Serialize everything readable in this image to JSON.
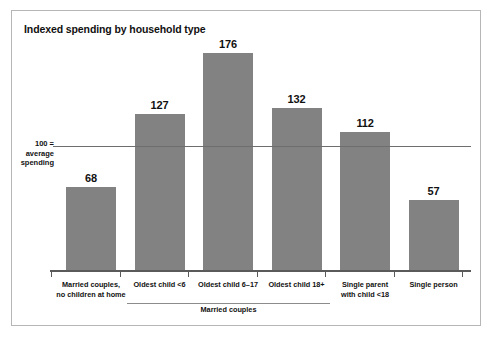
{
  "figure": {
    "title": "Indexed spending by household type",
    "frame_color": "#b6b6b6",
    "bar_color": "#828282",
    "axis_color": "#5a5a5a"
  },
  "reference": {
    "line1": "100 =",
    "line2": "average",
    "line3": "spending",
    "value": 100
  },
  "group": {
    "label": "Married couples"
  },
  "chart_data": {
    "type": "bar",
    "title": "Indexed spending by household type",
    "xlabel": "",
    "ylabel": "",
    "ylim": [
      0,
      185
    ],
    "grid": false,
    "legend": "none",
    "reference_line": {
      "value": 100,
      "label": "100 = average spending"
    },
    "categories": [
      "Married couples, no children at home",
      "Oldest child <6",
      "Oldest child 6–17",
      "Oldest child 18+",
      "Single parent with child <18",
      "Single person"
    ],
    "category_lines": [
      [
        "Married couples,",
        "no children at home"
      ],
      [
        "Oldest child <6"
      ],
      [
        "Oldest child 6–17"
      ],
      [
        "Oldest child 18+"
      ],
      [
        "Single parent",
        "with child <18"
      ],
      [
        "Single person"
      ]
    ],
    "values": [
      68,
      127,
      176,
      132,
      112,
      57
    ],
    "value_labels": [
      "68",
      "127",
      "176",
      "132",
      "112",
      "57"
    ],
    "group_annotation": {
      "label": "Married couples",
      "covers": [
        "Oldest child <6",
        "Oldest child 6–17",
        "Oldest child 18+"
      ]
    }
  }
}
